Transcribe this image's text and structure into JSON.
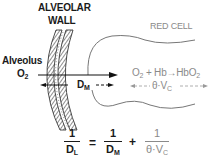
{
  "labels": {
    "wall_line1": "ALVEOLAR",
    "wall_line2": "WALL",
    "alveolus": "Alveolus",
    "o2": "O",
    "o2_sub": "2",
    "dm": "D",
    "dm_sub": "M",
    "red_cell": "RED CELL"
  },
  "reaction": {
    "o2": "O",
    "o2_sub": "2",
    "plus": "+ Hb",
    "arrow": "→",
    "product": "HbO",
    "product_sub": "2",
    "rate": "θ·V",
    "rate_sub": "C"
  },
  "equation": {
    "lhs_num": "1",
    "lhs_den": "D",
    "lhs_den_sub": "L",
    "equals": "=",
    "t1_num": "1",
    "t1_den": "D",
    "t1_den_sub": "M",
    "plus": "+",
    "t2_num": "1",
    "t2_den": "θ·V",
    "t2_den_sub": "C"
  },
  "colors": {
    "ink": "#1a1a1a",
    "gray": "#8a8a8a"
  }
}
